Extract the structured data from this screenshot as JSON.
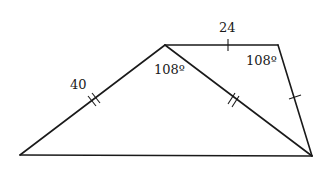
{
  "diagram": {
    "type": "geometry-figure",
    "vertices": {
      "A": [
        20,
        155
      ],
      "B": [
        165,
        45
      ],
      "C": [
        278,
        45
      ],
      "D": [
        312,
        156
      ]
    },
    "edges": [
      {
        "from": "A",
        "to": "B",
        "label": "40",
        "ticks": 2
      },
      {
        "from": "B",
        "to": "C",
        "label": "24",
        "ticks": 1
      },
      {
        "from": "C",
        "to": "D",
        "label": "",
        "ticks": 1
      },
      {
        "from": "B",
        "to": "D",
        "label": "",
        "ticks": 2
      },
      {
        "from": "A",
        "to": "D",
        "label": "",
        "ticks": 0
      }
    ],
    "labels": {
      "side_ab": "40",
      "side_bc": "24",
      "angle_b": "108º",
      "angle_c": "108º"
    },
    "colors": {
      "stroke": "#1a1a1a",
      "background": "#ffffff"
    }
  }
}
